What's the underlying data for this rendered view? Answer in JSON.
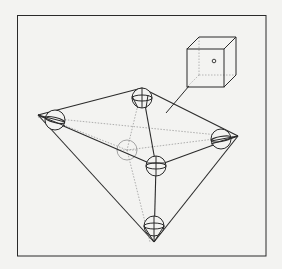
{
  "figure": {
    "type": "node-link diagram",
    "frame": {
      "x": 17,
      "y": 15,
      "width": 249,
      "height": 241
    },
    "colors": {
      "ink": "#2a2a2a",
      "hidden": "#9a9a9a",
      "paper": "#f3f3f1",
      "bleed": "#d9d9d6"
    },
    "nodes": [
      {
        "id": "top",
        "cx": 142,
        "cy": 98,
        "r": 10,
        "vertex": [
          142,
          88
        ],
        "visible": true
      },
      {
        "id": "left",
        "cx": 55,
        "cy": 120,
        "r": 10,
        "vertex": [
          38,
          115
        ],
        "visible": true
      },
      {
        "id": "right",
        "cx": 221,
        "cy": 139,
        "r": 10,
        "vertex": [
          238,
          136
        ],
        "visible": true
      },
      {
        "id": "front",
        "cx": 156,
        "cy": 164,
        "r": 10,
        "vertex": [
          156,
          168
        ],
        "visible": true
      },
      {
        "id": "back",
        "cx": 127,
        "cy": 150,
        "r": 10,
        "vertex": [
          127,
          152
        ],
        "visible": false
      },
      {
        "id": "bottom",
        "cx": 154,
        "cy": 226,
        "r": 10,
        "vertex": [
          154,
          242
        ],
        "visible": true
      }
    ],
    "edges": [
      {
        "from": "left",
        "to": "top",
        "style": "solid"
      },
      {
        "from": "top",
        "to": "right",
        "style": "solid"
      },
      {
        "from": "left",
        "to": "front",
        "style": "solid"
      },
      {
        "from": "front",
        "to": "right",
        "style": "solid"
      },
      {
        "from": "top",
        "to": "front",
        "style": "solid"
      },
      {
        "from": "left",
        "to": "bottom",
        "style": "solid"
      },
      {
        "from": "right",
        "to": "bottom",
        "style": "solid"
      },
      {
        "from": "front",
        "to": "bottom",
        "style": "solid"
      },
      {
        "from": "left",
        "to": "back",
        "style": "hidden"
      },
      {
        "from": "back",
        "to": "right",
        "style": "hidden"
      },
      {
        "from": "top",
        "to": "back",
        "style": "hidden"
      },
      {
        "from": "back",
        "to": "bottom",
        "style": "hidden"
      },
      {
        "from": "left",
        "to": "right",
        "style": "hidden"
      }
    ],
    "inset_cube": {
      "front_face": {
        "x": 187,
        "y": 49,
        "w": 37,
        "h": 38
      },
      "depth_offset": [
        12,
        -12
      ],
      "point": {
        "cx": 214,
        "cy": 61,
        "r": 1.8
      }
    },
    "leader_line": {
      "from": [
        189,
        86
      ],
      "to": [
        166,
        113
      ]
    }
  },
  "bleed_text": [
    "",
    "",
    "",
    "",
    "",
    "",
    "",
    "",
    "",
    "",
    "",
    "",
    "",
    ""
  ]
}
